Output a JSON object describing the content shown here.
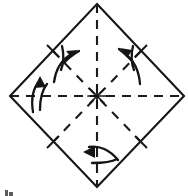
{
  "figure": {
    "kind": "origami-fold-diagram",
    "title": "Square sheet rotated as a diamond with four fold lines and four fold-direction arrows",
    "canvas": {
      "width": 188,
      "height": 196,
      "background": "#ffffff"
    },
    "colors": {
      "outline": "#161616",
      "fold_line": "#1b1b1b",
      "arrow": "#141414",
      "caption": "#5c5c5c",
      "background": "#ffffff"
    },
    "shape": {
      "name": "diamond-outline",
      "description": "square rotated 45 degrees",
      "stroke_style": "solid",
      "vertices": [
        {
          "label": "top",
          "x": 97,
          "y": 4
        },
        {
          "label": "right",
          "x": 184,
          "y": 96
        },
        {
          "label": "bottom",
          "x": 97,
          "y": 187
        },
        {
          "label": "left",
          "x": 10,
          "y": 96
        }
      ],
      "center": {
        "x": 97,
        "y": 96
      }
    },
    "fold_lines": [
      {
        "name": "vertical-fold-line",
        "stroke_style": "dashed",
        "from": {
          "x": 97,
          "y": 4
        },
        "to": {
          "x": 97,
          "y": 187
        }
      },
      {
        "name": "horizontal-fold-line",
        "stroke_style": "dashed",
        "from": {
          "x": 10,
          "y": 96
        },
        "to": {
          "x": 184,
          "y": 96
        }
      },
      {
        "name": "diagonal-fold-line-upper-left-to-lower-right",
        "stroke_style": "dashed",
        "from": {
          "x": 53,
          "y": 51
        },
        "to": {
          "x": 141,
          "y": 142
        }
      },
      {
        "name": "diagonal-fold-line-upper-right-to-lower-left",
        "stroke_style": "dashed",
        "from": {
          "x": 141,
          "y": 51
        },
        "to": {
          "x": 53,
          "y": 142
        }
      }
    ],
    "edge_ticks": [
      {
        "name": "tick-upper-left-edge",
        "x": 53,
        "y": 51
      },
      {
        "name": "tick-upper-right-edge",
        "x": 141,
        "y": 51
      },
      {
        "name": "tick-lower-left-edge",
        "x": 53,
        "y": 142
      },
      {
        "name": "tick-lower-right-edge",
        "x": 141,
        "y": 142
      }
    ],
    "arrows": [
      {
        "name": "fold-arrow-upper-left",
        "direction": "up-right toward upper-left edge midpoint",
        "style": "curved-fold-arrow",
        "tip": {
          "x": 73,
          "y": 52
        }
      },
      {
        "name": "fold-arrow-upper-right",
        "direction": "up-left toward upper-right edge midpoint",
        "style": "curved-fold-arrow",
        "tip": {
          "x": 127,
          "y": 50
        }
      },
      {
        "name": "fold-arrow-left",
        "direction": "upward across horizontal fold line",
        "style": "curved-fold-arrow",
        "tip": {
          "x": 40,
          "y": 80
        }
      },
      {
        "name": "fold-arrow-bottom",
        "direction": "leftward across vertical fold line",
        "style": "curved-fold-arrow",
        "tip": {
          "x": 88,
          "y": 155
        }
      }
    ],
    "caption_fragment": {
      "name": "cropped-caption-mark",
      "text": "",
      "note": "partial ink mark clipped at the bottom-left edge of the image",
      "x": 6,
      "y": 189
    }
  }
}
